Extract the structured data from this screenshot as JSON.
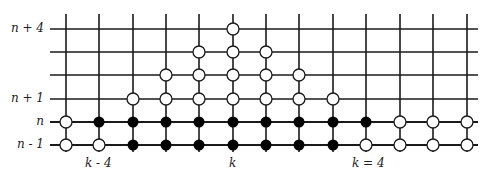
{
  "diagram": {
    "type": "lattice-grid",
    "colors": {
      "line": "#1a1a1a",
      "filled": "#000000",
      "open_fill": "#ffffff",
      "background": "#ffffff"
    },
    "columns_x": [
      66,
      99,
      133,
      166,
      199,
      233,
      266,
      299,
      333,
      366,
      400,
      433,
      467
    ],
    "rows_y": [
      29,
      52,
      75,
      99,
      122,
      145
    ],
    "row_labels": [
      {
        "row": 0,
        "text": "n + 4"
      },
      {
        "row": 3,
        "text": "n + 1"
      },
      {
        "row": 4,
        "text": "n"
      },
      {
        "row": 5,
        "text": "n - 1"
      }
    ],
    "column_labels": [
      {
        "col": 1,
        "text": "k - 4"
      },
      {
        "col": 5,
        "text": "k"
      },
      {
        "col": 9,
        "text": "k = 4"
      }
    ],
    "nodes": {
      "open": [
        [
          5,
          0
        ],
        [
          4,
          1
        ],
        [
          5,
          1
        ],
        [
          6,
          1
        ],
        [
          3,
          2
        ],
        [
          4,
          2
        ],
        [
          5,
          2
        ],
        [
          6,
          2
        ],
        [
          7,
          2
        ],
        [
          2,
          3
        ],
        [
          3,
          3
        ],
        [
          4,
          3
        ],
        [
          5,
          3
        ],
        [
          6,
          3
        ],
        [
          7,
          3
        ],
        [
          8,
          3
        ],
        [
          0,
          4
        ],
        [
          10,
          4
        ],
        [
          11,
          4
        ],
        [
          12,
          4
        ],
        [
          0,
          5
        ],
        [
          1,
          5
        ],
        [
          9,
          5
        ],
        [
          10,
          5
        ],
        [
          11,
          5
        ],
        [
          12,
          5
        ]
      ],
      "filled": [
        [
          1,
          4
        ],
        [
          2,
          4
        ],
        [
          3,
          4
        ],
        [
          4,
          4
        ],
        [
          5,
          4
        ],
        [
          6,
          4
        ],
        [
          7,
          4
        ],
        [
          8,
          4
        ],
        [
          9,
          4
        ],
        [
          2,
          5
        ],
        [
          3,
          5
        ],
        [
          4,
          5
        ],
        [
          5,
          5
        ],
        [
          6,
          5
        ],
        [
          7,
          5
        ],
        [
          8,
          5
        ]
      ]
    }
  }
}
